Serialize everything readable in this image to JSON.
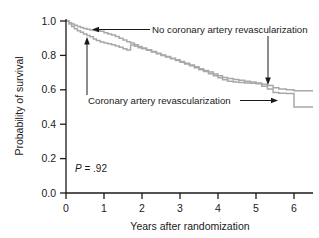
{
  "chart_data": {
    "type": "line",
    "subtype": "kaplan-meier-survival-step",
    "title": "",
    "xlabel": "Years after randomization",
    "ylabel": "Probability of survival",
    "xlim": [
      0,
      6.5
    ],
    "ylim": [
      0.0,
      1.0
    ],
    "xticks": [
      0,
      1,
      2,
      3,
      4,
      5,
      6
    ],
    "xticklabels": [
      "0",
      "1",
      "2",
      "3",
      "4",
      "5",
      "6"
    ],
    "yticks": [
      0.0,
      0.2,
      0.4,
      0.6,
      0.8,
      1.0
    ],
    "yticklabels": [
      "0.0",
      "0.2",
      "0.4",
      "0.6",
      "0.8",
      "1.0"
    ],
    "grid": false,
    "legend": "annotations-with-leader-lines",
    "line_color": "#a8a8a8",
    "axis_color": "#1a1a1a",
    "annotations": [
      {
        "name": "p-value",
        "text_prefix": "P",
        "text_suffix": " = .92",
        "x": 0.55,
        "y": 0.155
      }
    ],
    "series": [
      {
        "name": "No coronary artery revascularization",
        "label": "No coronary artery revascularization",
        "color": "#a8a8a8",
        "final_value": 0.595,
        "points": [
          [
            0.0,
            1.0
          ],
          [
            0.08,
            0.99
          ],
          [
            0.15,
            0.982
          ],
          [
            0.22,
            0.975
          ],
          [
            0.3,
            0.968
          ],
          [
            0.38,
            0.962
          ],
          [
            0.46,
            0.957
          ],
          [
            0.55,
            0.952
          ],
          [
            0.63,
            0.948
          ],
          [
            0.72,
            0.945
          ],
          [
            0.8,
            0.943
          ],
          [
            0.9,
            0.94
          ],
          [
            1.0,
            0.932
          ],
          [
            1.1,
            0.925
          ],
          [
            1.2,
            0.918
          ],
          [
            1.3,
            0.91
          ],
          [
            1.4,
            0.9
          ],
          [
            1.5,
            0.89
          ],
          [
            1.6,
            0.88
          ],
          [
            1.7,
            0.872
          ],
          [
            1.8,
            0.862
          ],
          [
            1.9,
            0.852
          ],
          [
            2.0,
            0.843
          ],
          [
            2.12,
            0.833
          ],
          [
            2.25,
            0.822
          ],
          [
            2.38,
            0.812
          ],
          [
            2.5,
            0.802
          ],
          [
            2.62,
            0.793
          ],
          [
            2.75,
            0.783
          ],
          [
            2.88,
            0.774
          ],
          [
            3.0,
            0.765
          ],
          [
            3.12,
            0.754
          ],
          [
            3.25,
            0.744
          ],
          [
            3.38,
            0.734
          ],
          [
            3.5,
            0.722
          ],
          [
            3.62,
            0.712
          ],
          [
            3.75,
            0.703
          ],
          [
            3.88,
            0.692
          ],
          [
            4.0,
            0.682
          ],
          [
            4.12,
            0.672
          ],
          [
            4.25,
            0.665
          ],
          [
            4.4,
            0.66
          ],
          [
            4.55,
            0.655
          ],
          [
            4.7,
            0.65
          ],
          [
            4.85,
            0.645
          ],
          [
            5.0,
            0.64
          ],
          [
            5.15,
            0.632
          ],
          [
            5.3,
            0.625
          ],
          [
            5.45,
            0.612
          ],
          [
            5.6,
            0.605
          ],
          [
            5.8,
            0.6
          ],
          [
            6.0,
            0.595
          ],
          [
            6.5,
            0.595
          ]
        ]
      },
      {
        "name": "Coronary artery revascularization",
        "label": "Coronary artery revascularization",
        "color": "#a8a8a8",
        "final_value": 0.5,
        "points": [
          [
            0.0,
            1.0
          ],
          [
            0.08,
            0.982
          ],
          [
            0.15,
            0.968
          ],
          [
            0.22,
            0.955
          ],
          [
            0.3,
            0.944
          ],
          [
            0.38,
            0.934
          ],
          [
            0.46,
            0.925
          ],
          [
            0.55,
            0.916
          ],
          [
            0.63,
            0.908
          ],
          [
            0.72,
            0.896
          ],
          [
            0.8,
            0.886
          ],
          [
            0.9,
            0.878
          ],
          [
            1.0,
            0.872
          ],
          [
            1.1,
            0.868
          ],
          [
            1.2,
            0.862
          ],
          [
            1.3,
            0.855
          ],
          [
            1.4,
            0.847
          ],
          [
            1.5,
            0.839
          ],
          [
            1.6,
            0.831
          ],
          [
            1.7,
            0.861
          ],
          [
            1.8,
            0.853
          ],
          [
            1.9,
            0.845
          ],
          [
            2.0,
            0.838
          ],
          [
            2.12,
            0.83
          ],
          [
            2.25,
            0.82
          ],
          [
            2.38,
            0.81
          ],
          [
            2.5,
            0.8
          ],
          [
            2.62,
            0.79
          ],
          [
            2.75,
            0.78
          ],
          [
            2.88,
            0.77
          ],
          [
            3.0,
            0.76
          ],
          [
            3.12,
            0.75
          ],
          [
            3.25,
            0.74
          ],
          [
            3.38,
            0.728
          ],
          [
            3.5,
            0.716
          ],
          [
            3.62,
            0.706
          ],
          [
            3.75,
            0.694
          ],
          [
            3.88,
            0.682
          ],
          [
            4.0,
            0.67
          ],
          [
            4.12,
            0.658
          ],
          [
            4.25,
            0.65
          ],
          [
            4.4,
            0.645
          ],
          [
            4.55,
            0.642
          ],
          [
            4.7,
            0.64
          ],
          [
            4.85,
            0.638
          ],
          [
            5.0,
            0.635
          ],
          [
            5.15,
            0.62
          ],
          [
            5.3,
            0.605
          ],
          [
            5.45,
            0.585
          ],
          [
            5.6,
            0.58
          ],
          [
            5.8,
            0.578
          ],
          [
            6.0,
            0.5
          ],
          [
            6.5,
            0.5
          ]
        ]
      }
    ]
  },
  "labels": {
    "upper_annotation": "No coronary artery revascularization",
    "lower_annotation": "Coronary artery revascularization",
    "p_italic": "P",
    "p_rest": " = .92",
    "ylabel": "Probability of survival",
    "xlabel": "Years after randomization"
  }
}
